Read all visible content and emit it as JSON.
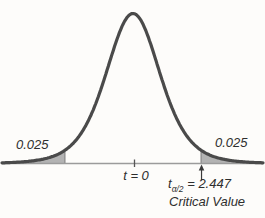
{
  "figure": {
    "background_color": "#fdfcfa",
    "curve_color": "#4a4a4a",
    "axis_color": "#9b9b9b",
    "shade_color": "#b3b3b3",
    "shade_edge_color": "#7d7d7d",
    "text_color": "#2e2e2e"
  },
  "chart_data": {
    "type": "area",
    "curve": "t-distribution bell curve, two-tailed critical region",
    "center_t": 0,
    "critical_value": 2.447,
    "left_tail_area": 0.025,
    "right_tail_area": 0.025,
    "labels": {
      "left_tail": "0.025",
      "right_tail": "0.025",
      "axis_center": "t = 0",
      "critical_var": "t",
      "critical_sub": "α/2",
      "critical_eq": " = 2.447",
      "critical_caption": "Critical Value"
    }
  }
}
